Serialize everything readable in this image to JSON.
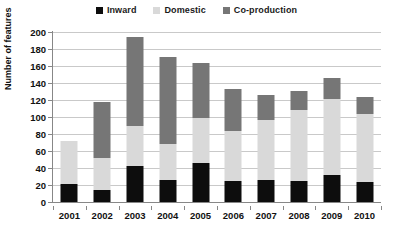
{
  "chart_data": {
    "type": "bar",
    "subtype": "stacked-vertical",
    "title": "",
    "xlabel": "",
    "ylabel": "Number of features",
    "categories": [
      "2001",
      "2002",
      "2003",
      "2004",
      "2005",
      "2006",
      "2007",
      "2008",
      "2009",
      "2010"
    ],
    "series": [
      {
        "name": "Inward",
        "color": "#0d0d0d",
        "values": [
          21,
          14,
          42,
          26,
          46,
          25,
          26,
          25,
          32,
          24
        ]
      },
      {
        "name": "Domestic",
        "color": "#d9d9d9",
        "values": [
          51,
          38,
          47,
          42,
          53,
          59,
          71,
          83,
          89,
          80
        ]
      },
      {
        "name": "Co-production",
        "color": "#767676",
        "values": [
          0,
          66,
          105,
          103,
          64,
          49,
          29,
          23,
          25,
          20
        ]
      }
    ],
    "totals": [
      72,
      118,
      194,
      171,
      163,
      133,
      126,
      131,
      146,
      124
    ],
    "ylim": [
      0,
      200
    ],
    "ytick_step": 20,
    "ytick_labels": [
      "0",
      "20",
      "40",
      "60",
      "80",
      "100",
      "120",
      "140",
      "160",
      "180",
      "200"
    ],
    "grid": "horizontal",
    "legend_position": "top-center"
  },
  "legend": {
    "entries": [
      {
        "label": "Inward",
        "color": "#0d0d0d",
        "marker": "square-marker"
      },
      {
        "label": "Domestic",
        "color": "#d9d9d9",
        "marker": "square-marker"
      },
      {
        "label": "Co-production",
        "color": "#767676",
        "marker": "square-marker"
      }
    ]
  },
  "axes": {
    "y_title": "Number of features",
    "y_ticks": [
      "200",
      "180",
      "160",
      "140",
      "120",
      "100",
      "80",
      "60",
      "40",
      "20",
      "0"
    ],
    "x_ticks": [
      "2001",
      "2002",
      "2003",
      "2004",
      "2005",
      "2006",
      "2007",
      "2008",
      "2009",
      "2010"
    ]
  }
}
